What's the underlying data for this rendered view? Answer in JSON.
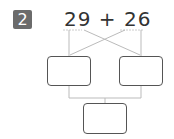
{
  "problem": {
    "number": "2",
    "expression": "29 + 26",
    "operand_a": "29",
    "operator": "+",
    "operand_b": "26"
  },
  "boxes": {
    "left_value": "",
    "right_value": "",
    "result_value": ""
  },
  "colors": {
    "badge_bg": "#6b6b6b",
    "line": "#bbbbbb",
    "box_border": "#555555",
    "text": "#333333"
  }
}
